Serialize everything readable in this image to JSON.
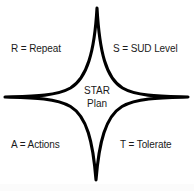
{
  "diagram": {
    "title": "STAR Plan",
    "shape": "four-pointed-star",
    "stroke_color": "#000000",
    "fill_color": "#ffffff",
    "background_color": "#ffffff",
    "center": {
      "line1": "STAR",
      "line2": "Plan"
    },
    "labels": {
      "top_left": "R = Repeat",
      "top_right": "S = SUD Level",
      "bottom_left": "A = Actions",
      "bottom_right": "T = Tolerate"
    },
    "points": [
      {
        "position": "top",
        "x": 97,
        "y": 8
      },
      {
        "position": "right",
        "x": 188,
        "y": 97
      },
      {
        "position": "bottom",
        "x": 96,
        "y": 180
      },
      {
        "position": "left",
        "x": 5,
        "y": 97
      }
    ]
  }
}
